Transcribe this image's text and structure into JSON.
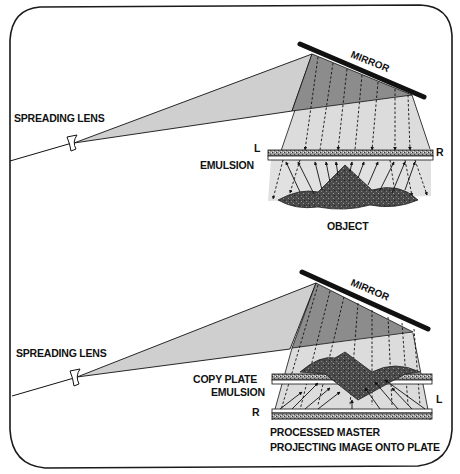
{
  "figure": {
    "type": "holography-setup-diagram",
    "panels": [
      {
        "id": "top",
        "title": "Recording hologram",
        "labels": {
          "spreading_lens": "SPREADING LENS",
          "mirror": "MIRROR",
          "emulsion": "EMULSION",
          "left_marker": "L",
          "right_marker": "R",
          "object": "OBJECT"
        }
      },
      {
        "id": "bottom",
        "title": "Copying hologram",
        "labels": {
          "spreading_lens": "SPREADING LENS",
          "mirror": "MIRROR",
          "copy_plate_line1": "COPY PLATE",
          "copy_plate_line2": "EMULSION",
          "left_marker": "L",
          "right_marker": "R",
          "caption_line1": "PROCESSED MASTER",
          "caption_line2": "PROJECTING IMAGE ONTO PLATE"
        }
      }
    ],
    "colors": {
      "frame": "#1a1a1a",
      "beam_light": "#d9d9d9",
      "beam_mid": "#c4c4c4",
      "mirror_zone": "#8a8a8a",
      "ink": "#111111",
      "plate_fill": "#b5b5b5",
      "object_fill": "#4a4a4a"
    }
  }
}
